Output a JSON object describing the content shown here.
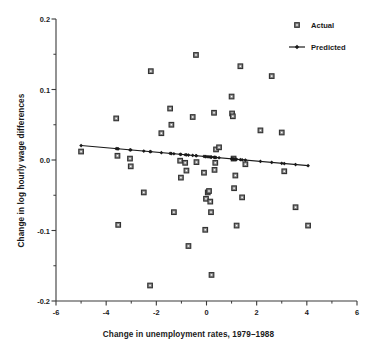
{
  "chart_data": {
    "type": "scatter",
    "title": "",
    "xlabel": "Change in unemployment rates, 1979–1988",
    "ylabel": "Change in log hourly wage differences",
    "xlim": [
      -6,
      6
    ],
    "ylim": [
      -0.2,
      0.2
    ],
    "grid": false,
    "xticks": [
      -6,
      -4,
      -2,
      0,
      2,
      4,
      6
    ],
    "xtick_labels": [
      "-6",
      "-4",
      "-2",
      "0",
      "2",
      "4",
      "6"
    ],
    "xminor_ticks": [
      -5,
      -3,
      -1,
      1,
      3,
      5
    ],
    "yticks": [
      0.2,
      0.1,
      0.0,
      -0.1,
      -0.2
    ],
    "ytick_labels": [
      "0.2",
      "0.1",
      "0.0",
      "-0.1",
      "-0.2"
    ],
    "yminor_ticks": [
      0.15,
      0.05,
      -0.05,
      -0.15
    ],
    "legend_position": "top-right",
    "series": [
      {
        "name": "Actual",
        "type": "scatter",
        "marker": "square",
        "marker_color": "#8c8c8c",
        "marker_edge_color": "#333333",
        "points": [
          [
            -5.0,
            0.012
          ],
          [
            -3.6,
            0.059
          ],
          [
            -3.55,
            0.006
          ],
          [
            -3.52,
            -0.092
          ],
          [
            -3.05,
            0.002
          ],
          [
            -3.02,
            -0.009
          ],
          [
            -2.5,
            -0.046
          ],
          [
            -2.22,
            0.126
          ],
          [
            -2.25,
            -0.178
          ],
          [
            -1.8,
            0.038
          ],
          [
            -1.45,
            0.073
          ],
          [
            -1.4,
            0.05
          ],
          [
            -1.3,
            -0.074
          ],
          [
            -1.05,
            -0.001
          ],
          [
            -1.02,
            -0.025
          ],
          [
            -0.85,
            -0.004
          ],
          [
            -0.8,
            -0.015
          ],
          [
            -0.72,
            -0.122
          ],
          [
            -0.55,
            0.061
          ],
          [
            -0.42,
            0.149
          ],
          [
            -0.4,
            -0.003
          ],
          [
            -0.1,
            -0.018
          ],
          [
            -0.05,
            -0.099
          ],
          [
            -0.02,
            -0.055
          ],
          [
            0.05,
            -0.046
          ],
          [
            0.1,
            -0.044
          ],
          [
            0.15,
            -0.059
          ],
          [
            0.18,
            -0.074
          ],
          [
            0.2,
            -0.163
          ],
          [
            0.3,
            0.067
          ],
          [
            0.32,
            -0.014
          ],
          [
            0.35,
            -0.004
          ],
          [
            0.38,
            0.015
          ],
          [
            0.5,
            0.018
          ],
          [
            1.0,
            0.09
          ],
          [
            1.02,
            0.066
          ],
          [
            1.05,
            0.062
          ],
          [
            1.08,
            0.002
          ],
          [
            1.1,
            -0.04
          ],
          [
            1.15,
            -0.022
          ],
          [
            1.2,
            -0.093
          ],
          [
            1.35,
            0.133
          ],
          [
            1.42,
            -0.053
          ],
          [
            1.55,
            -0.006
          ],
          [
            2.15,
            0.042
          ],
          [
            2.6,
            0.119
          ],
          [
            3.0,
            0.039
          ],
          [
            3.1,
            -0.016
          ],
          [
            3.55,
            -0.067
          ],
          [
            4.05,
            -0.093
          ]
        ]
      },
      {
        "name": "Predicted",
        "type": "line",
        "marker": "diamond",
        "line_color": "#1a1a1a",
        "marker_color": "#1a1a1a",
        "points": [
          [
            -5.0,
            0.0205
          ],
          [
            -3.6,
            0.0158
          ],
          [
            -3.55,
            0.0157
          ],
          [
            -3.52,
            0.0156
          ],
          [
            -3.05,
            0.015
          ],
          [
            -3.02,
            0.015
          ],
          [
            -2.5,
            0.0142
          ],
          [
            -2.25,
            0.0138
          ],
          [
            -2.22,
            0.0137
          ],
          [
            -1.8,
            0.0131
          ],
          [
            -1.45,
            0.0125
          ],
          [
            -1.4,
            0.0124
          ],
          [
            -1.3,
            0.0122
          ],
          [
            -1.05,
            0.0118
          ],
          [
            -1.02,
            0.0117
          ],
          [
            -0.85,
            0.0114
          ],
          [
            -0.8,
            0.0113
          ],
          [
            -0.72,
            0.0111
          ],
          [
            -0.55,
            0.0108
          ],
          [
            -0.42,
            0.0105
          ],
          [
            -0.4,
            0.0105
          ],
          [
            -0.1,
            0.01
          ],
          [
            -0.05,
            0.0099
          ],
          [
            -0.02,
            0.0098
          ],
          [
            0.05,
            0.0097
          ],
          [
            0.1,
            0.0096
          ],
          [
            0.15,
            0.0095
          ],
          [
            0.18,
            0.0094
          ],
          [
            0.2,
            0.0094
          ],
          [
            0.3,
            0.0092
          ],
          [
            0.32,
            0.0092
          ],
          [
            0.35,
            0.0091
          ],
          [
            0.38,
            0.009
          ],
          [
            0.5,
            0.0088
          ],
          [
            1.0,
            0.0079
          ],
          [
            1.02,
            0.0079
          ],
          [
            1.05,
            0.0078
          ],
          [
            1.08,
            0.0078
          ],
          [
            1.1,
            0.0077
          ],
          [
            1.15,
            0.0076
          ],
          [
            1.2,
            0.0075
          ],
          [
            1.35,
            0.0073
          ],
          [
            1.42,
            0.0071
          ],
          [
            1.55,
            0.0069
          ],
          [
            2.15,
            0.0058
          ],
          [
            2.6,
            0.005
          ],
          [
            3.0,
            0.0042
          ],
          [
            3.1,
            0.0041
          ],
          [
            3.55,
            0.0032
          ],
          [
            4.05,
            0.0023
          ]
        ],
        "fit_line": {
          "x0": -5.0,
          "y0": 0.0205,
          "x1": 4.05,
          "y1": -0.008
        }
      }
    ],
    "legend": [
      {
        "label": "Actual",
        "marker": "square"
      },
      {
        "label": "Predicted",
        "marker": "line-diamond"
      }
    ]
  },
  "colors": {
    "axis": "#3a3a3a",
    "text": "#1a1a1a",
    "marker_fill": "#8f8f8f",
    "marker_edge": "#333333",
    "line": "#1a1a1a",
    "background": "#ffffff"
  }
}
